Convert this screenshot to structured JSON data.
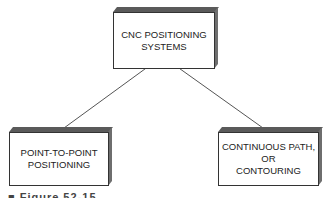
{
  "diagram": {
    "root": {
      "label": "CNC POSITIONING\nSYSTEMS"
    },
    "children": [
      {
        "label": "POINT-TO-POINT\nPOSITIONING"
      },
      {
        "label": "CONTINUOUS PATH,\nOR\nCONTOURING"
      }
    ],
    "edges": [
      {
        "from": "CNC POSITIONING SYSTEMS",
        "to": "POINT-TO-POINT POSITIONING"
      },
      {
        "from": "CNC POSITIONING SYSTEMS",
        "to": "CONTINUOUS PATH, OR CONTOURING"
      }
    ],
    "caption": "■ Figure 52-15"
  }
}
